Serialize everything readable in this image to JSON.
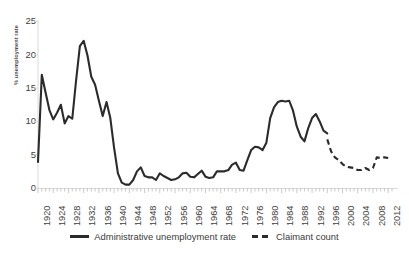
{
  "chart_data": {
    "type": "line",
    "title": "",
    "xlabel": "",
    "ylabel": "% unemployment rate",
    "ylim": [
      0,
      25
    ],
    "xlim": [
      1920,
      2013
    ],
    "ytick_labels": [
      "0",
      "5",
      "10",
      "15",
      "20",
      "25"
    ],
    "ytick_values": [
      0,
      5,
      10,
      15,
      20,
      25
    ],
    "xtick_labels": [
      "1920",
      "1924",
      "1928",
      "1932",
      "1936",
      "1940",
      "1944",
      "1948",
      "1952",
      "1956",
      "1960",
      "1964",
      "1968",
      "1972",
      "1976",
      "1980",
      "1984",
      "1988",
      "1992",
      "1996",
      "2000",
      "2004",
      "2008",
      "2012"
    ],
    "xtick_values": [
      1920,
      1924,
      1928,
      1932,
      1936,
      1940,
      1944,
      1948,
      1952,
      1956,
      1960,
      1964,
      1968,
      1972,
      1976,
      1980,
      1984,
      1988,
      1992,
      1996,
      2000,
      2004,
      2008,
      2012
    ],
    "minor_tick_interval": 1,
    "grid": false,
    "legend_position": "bottom-center",
    "line_color": "#2b2b2b",
    "axis_color": "#d9d9d9",
    "series": [
      {
        "name": "Administrative unemployment rate",
        "style": "solid",
        "x": [
          1920,
          1921,
          1922,
          1923,
          1924,
          1925,
          1926,
          1927,
          1928,
          1929,
          1930,
          1931,
          1932,
          1933,
          1934,
          1935,
          1936,
          1937,
          1938,
          1939,
          1940,
          1941,
          1942,
          1943,
          1944,
          1945,
          1946,
          1947,
          1948,
          1949,
          1950,
          1951,
          1952,
          1953,
          1954,
          1955,
          1956,
          1957,
          1958,
          1959,
          1960,
          1961,
          1962,
          1963,
          1964,
          1965,
          1966,
          1967,
          1968,
          1969,
          1970,
          1971,
          1972,
          1973,
          1974,
          1975,
          1976,
          1977,
          1978,
          1979,
          1980,
          1981,
          1982,
          1983,
          1984,
          1985,
          1986,
          1987,
          1988,
          1989,
          1990,
          1991,
          1992,
          1993,
          1994,
          1995,
          1996
        ],
        "values": [
          3.9,
          17.0,
          14.3,
          11.7,
          10.3,
          11.3,
          12.5,
          9.7,
          10.8,
          10.4,
          16.1,
          21.3,
          22.1,
          19.9,
          16.7,
          15.5,
          13.1,
          10.8,
          12.9,
          10.5,
          6.0,
          2.2,
          0.8,
          0.5,
          0.5,
          1.2,
          2.5,
          3.1,
          1.8,
          1.6,
          1.6,
          1.2,
          2.2,
          1.8,
          1.5,
          1.2,
          1.3,
          1.6,
          2.2,
          2.3,
          1.7,
          1.6,
          2.1,
          2.6,
          1.7,
          1.5,
          1.6,
          2.5,
          2.5,
          2.5,
          2.7,
          3.5,
          3.8,
          2.7,
          2.6,
          4.2,
          5.7,
          6.2,
          6.1,
          5.7,
          6.8,
          10.5,
          12.1,
          12.9,
          13.1,
          13.0,
          13.1,
          11.6,
          9.2,
          7.7,
          7.0,
          9.0,
          10.5,
          11.1,
          10.0,
          8.6,
          8.2
        ]
      },
      {
        "name": "Claimant count",
        "style": "dashed",
        "x": [
          1996,
          1997,
          1998,
          1999,
          2000,
          2001,
          2002,
          2003,
          2004,
          2005,
          2006,
          2007,
          2008,
          2009,
          2010,
          2011,
          2012
        ],
        "values": [
          7.3,
          5.5,
          4.6,
          4.2,
          3.6,
          3.2,
          3.1,
          3.0,
          2.7,
          2.7,
          3.0,
          2.7,
          3.0,
          4.6,
          4.5,
          4.6,
          4.5
        ]
      }
    ]
  }
}
